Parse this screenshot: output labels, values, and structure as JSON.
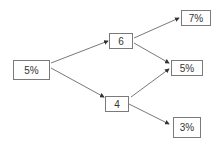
{
  "diagram": {
    "type": "binomial-tree",
    "nodes": [
      {
        "id": "root",
        "label": "5%",
        "x": 13,
        "y": 60,
        "w": 37,
        "h": 20
      },
      {
        "id": "up",
        "label": "6",
        "x": 109,
        "y": 33,
        "w": 24,
        "h": 16
      },
      {
        "id": "down",
        "label": "4",
        "x": 105,
        "y": 96,
        "w": 24,
        "h": 16
      },
      {
        "id": "upup",
        "label": "7%",
        "x": 181,
        "y": 10,
        "w": 30,
        "h": 16
      },
      {
        "id": "mid",
        "label": "5%",
        "x": 171,
        "y": 60,
        "w": 32,
        "h": 16
      },
      {
        "id": "downdown",
        "label": "3%",
        "x": 173,
        "y": 117,
        "w": 28,
        "h": 21
      }
    ],
    "edges": [
      {
        "from": "root",
        "to": "up"
      },
      {
        "from": "root",
        "to": "down"
      },
      {
        "from": "up",
        "to": "upup"
      },
      {
        "from": "up",
        "to": "mid"
      },
      {
        "from": "down",
        "to": "mid"
      },
      {
        "from": "down",
        "to": "downdown"
      }
    ],
    "colors": {
      "line": "#555555",
      "border": "#7a7a7a",
      "text": "#333333"
    }
  }
}
